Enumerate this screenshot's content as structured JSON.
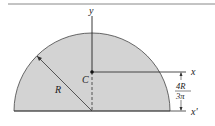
{
  "figure": {
    "shape": "semicircle",
    "fill_color": "#d3d3d3",
    "stroke_color": "#333333",
    "labels": {
      "y_axis": "y",
      "x_axis": "x",
      "x_prime_axis": "x'",
      "centroid": "C",
      "radius": "R",
      "offset_numerator": "4R",
      "offset_denominator": "3π"
    }
  }
}
